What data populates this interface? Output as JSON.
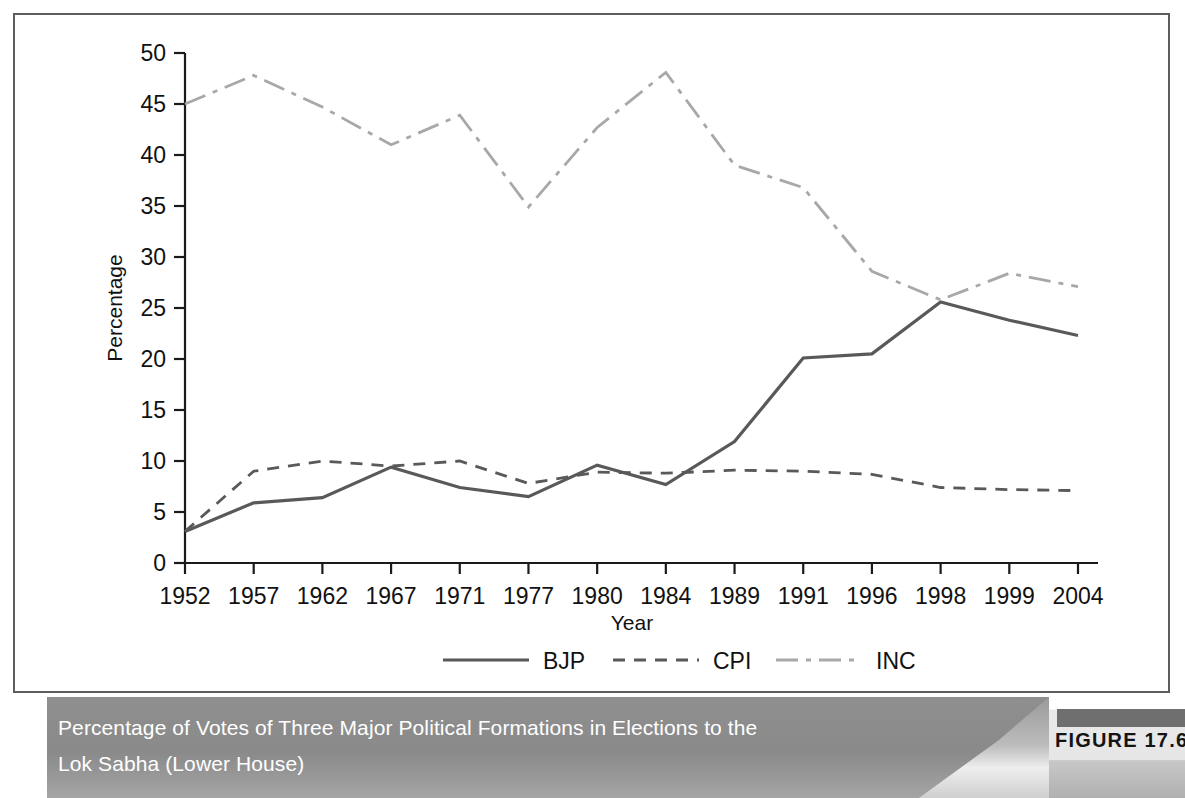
{
  "figure": {
    "number_label": "FIGURE 17.6",
    "caption_line1": "Percentage of Votes of Three Major Political Formations in Elections to the",
    "caption_line2": "Lok Sabha (Lower House)"
  },
  "colors": {
    "bjp": "#595959",
    "cpi": "#595959",
    "inc": "#a8a8a8",
    "axis": "#1a1a1a",
    "frame": "#5d5d5d",
    "caption_band": "#8f8f8f",
    "caption_text": "#ffffff",
    "badge_bar": "#6f6f6f"
  },
  "chart_data": {
    "type": "line",
    "title": "",
    "xlabel": "Year",
    "ylabel": "Percentage",
    "ylim": [
      0,
      50
    ],
    "ytick_step": 5,
    "grid": false,
    "legend_position": "bottom",
    "categories": [
      "1952",
      "1957",
      "1962",
      "1967",
      "1971",
      "1977",
      "1980",
      "1984",
      "1989",
      "1991",
      "1996",
      "1998",
      "1999",
      "2004"
    ],
    "yticks": [
      "0",
      "5",
      "10",
      "15",
      "20",
      "25",
      "30",
      "35",
      "40",
      "45",
      "50"
    ],
    "series": [
      {
        "name": "BJP",
        "style": "solid",
        "color": "#595959",
        "values": [
          3.1,
          5.9,
          6.4,
          9.4,
          7.4,
          6.5,
          9.6,
          7.7,
          11.9,
          20.1,
          20.5,
          25.6,
          23.8,
          22.3
        ]
      },
      {
        "name": "CPI",
        "style": "dashed",
        "color": "#595959",
        "values": [
          3.1,
          9.0,
          10.0,
          9.5,
          10.0,
          7.8,
          8.9,
          8.8,
          9.1,
          9.0,
          8.7,
          7.4,
          7.2,
          7.1
        ]
      },
      {
        "name": "INC",
        "style": "dashdot",
        "color": "#a8a8a8",
        "values": [
          45.0,
          47.8,
          44.7,
          41.0,
          43.9,
          34.9,
          42.7,
          48.1,
          39.0,
          36.8,
          28.6,
          25.8,
          28.4,
          27.1
        ]
      }
    ]
  }
}
